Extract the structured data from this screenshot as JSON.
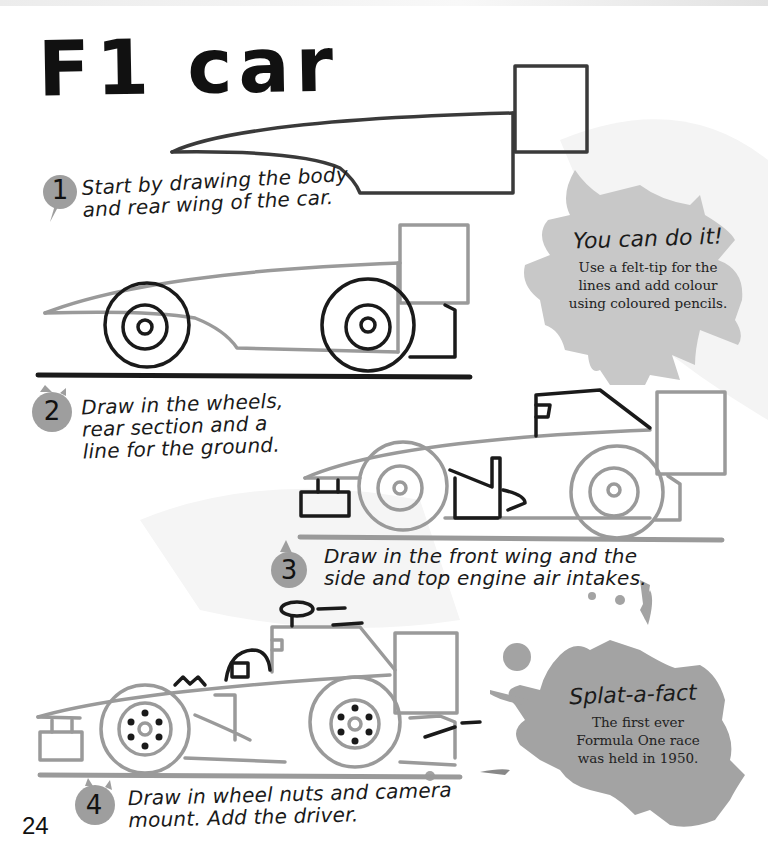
{
  "page": {
    "title": "F1 car",
    "page_number": "24"
  },
  "steps": [
    {
      "number": "1",
      "lines": [
        "Start by drawing the body",
        "and rear wing of the car."
      ]
    },
    {
      "number": "2",
      "lines": [
        "Draw in the wheels,",
        "rear section and a",
        "line for the ground."
      ]
    },
    {
      "number": "3",
      "lines": [
        "Draw in the front wing and the",
        "side and top engine air intakes."
      ]
    },
    {
      "number": "4",
      "lines": [
        "Draw in wheel nuts and camera",
        "mount. Add the driver."
      ]
    }
  ],
  "tip_box": {
    "title": "You can do it!",
    "lines": [
      "Use a felt-tip for the",
      "lines and add colour",
      "using coloured pencils."
    ]
  },
  "fact_box": {
    "title": "Splat-a-fact",
    "lines": [
      "The first ever",
      "Formula One race",
      "was held in 1950."
    ]
  },
  "colors": {
    "ink": "#1a1a1a",
    "pencil_grey": "#8c8c8c",
    "splat_light": "#c8c8c8",
    "splat_dark": "#a3a3a3",
    "background": "#ffffff"
  }
}
